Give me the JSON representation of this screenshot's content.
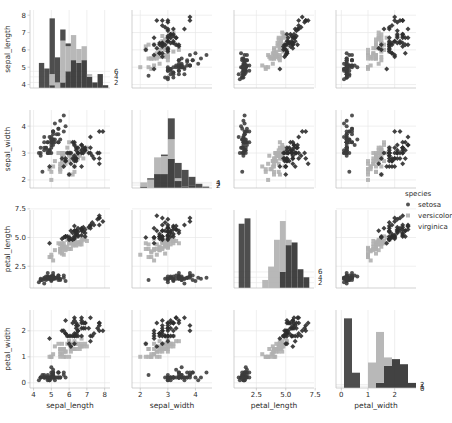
{
  "figure": {
    "kind": "pairplot",
    "background": "#ffffff",
    "grid_color": "#e8e8e8",
    "spine_color": "#bdbdbd"
  },
  "variables": [
    "sepal_length",
    "sepal_width",
    "petal_length",
    "petal_width"
  ],
  "axis_labels": {
    "sepal_length": "sepal_length",
    "sepal_width": "sepal_width",
    "petal_length": "petal_length",
    "petal_width": "petal_width"
  },
  "axes_config": {
    "sepal_length": {
      "min": 3.8,
      "max": 8.3,
      "ticks": [
        4,
        5,
        6,
        7,
        8
      ],
      "tick_labels": [
        "4",
        "5",
        "6",
        "7",
        "8"
      ]
    },
    "sepal_width": {
      "min": 1.7,
      "max": 4.6,
      "ticks": [
        2,
        3,
        4
      ],
      "tick_labels": [
        "2",
        "3",
        "4"
      ]
    },
    "petal_length": {
      "min": 0.6,
      "max": 7.4,
      "ticks": [
        2.5,
        5.0,
        7.5
      ],
      "tick_labels": [
        "2.5",
        "5.0",
        "7.5"
      ]
    },
    "petal_width": {
      "min": -0.2,
      "max": 2.8,
      "ticks": [
        0,
        1,
        2
      ],
      "tick_labels": [
        "0",
        "1",
        "2"
      ]
    }
  },
  "diagonal_axes_config": {
    "sepal_length": {
      "ticks": [
        2,
        4,
        6
      ],
      "tick_labels": [
        "2",
        "4",
        "6"
      ]
    },
    "sepal_width": {
      "ticks": [
        2,
        3,
        4
      ],
      "tick_labels": [
        "2",
        "3",
        "4"
      ]
    },
    "petal_length": {
      "ticks": [
        2,
        4,
        6
      ],
      "tick_labels": [
        "2",
        "4",
        "6"
      ]
    },
    "petal_width": {
      "ticks": [
        0,
        1,
        2
      ],
      "tick_labels": [
        "0",
        "1",
        "2"
      ]
    }
  },
  "legend": {
    "title": "species",
    "entries": [
      {
        "label": "setosa",
        "color": "#3b3b3b",
        "marker": "circle"
      },
      {
        "label": "versicolor",
        "color": "#b0b0b0",
        "marker": "square"
      },
      {
        "label": "virginica",
        "color": "#2e2e2e",
        "marker": "diamond"
      }
    ]
  },
  "chart_data": {
    "type": "scatter",
    "title": "",
    "xlabel": "",
    "ylabel": "",
    "pairplot": true,
    "diagonal": "histogram",
    "grid": true,
    "legend_position": "right",
    "variables": [
      "sepal_length",
      "sepal_width",
      "petal_length",
      "petal_width"
    ],
    "hue": "species",
    "series": [
      {
        "name": "setosa",
        "color": "#3b3b3b",
        "marker": "circle",
        "sepal_length": [
          5.1,
          4.9,
          4.7,
          4.6,
          5.0,
          5.4,
          4.6,
          5.0,
          4.4,
          4.9,
          5.4,
          4.8,
          4.8,
          4.3,
          5.8,
          5.7,
          5.4,
          5.1,
          5.7,
          5.1,
          5.4,
          5.1,
          4.6,
          5.1,
          4.8,
          5.0,
          5.0,
          5.2,
          5.2,
          4.7,
          4.8,
          5.4,
          5.2,
          5.5,
          4.9,
          5.0,
          5.5,
          4.9,
          4.4,
          5.1,
          5.0,
          4.5,
          4.4,
          5.0,
          5.1,
          4.8,
          5.1,
          4.6,
          5.3,
          5.0
        ],
        "sepal_width": [
          3.5,
          3.0,
          3.2,
          3.1,
          3.6,
          3.9,
          3.4,
          3.4,
          2.9,
          3.1,
          3.7,
          3.4,
          3.0,
          3.0,
          4.0,
          4.4,
          3.9,
          3.5,
          3.8,
          3.8,
          3.4,
          3.7,
          3.6,
          3.3,
          3.4,
          3.0,
          3.4,
          3.5,
          3.4,
          3.2,
          3.1,
          3.4,
          4.1,
          4.2,
          3.1,
          3.2,
          3.5,
          3.6,
          3.0,
          3.4,
          3.5,
          2.3,
          3.2,
          3.5,
          3.8,
          3.0,
          3.8,
          3.2,
          3.7,
          3.3
        ],
        "petal_length": [
          1.4,
          1.4,
          1.3,
          1.5,
          1.4,
          1.7,
          1.4,
          1.5,
          1.4,
          1.5,
          1.5,
          1.6,
          1.4,
          1.1,
          1.2,
          1.5,
          1.3,
          1.4,
          1.7,
          1.5,
          1.7,
          1.5,
          1.0,
          1.7,
          1.9,
          1.6,
          1.6,
          1.5,
          1.4,
          1.6,
          1.6,
          1.5,
          1.5,
          1.4,
          1.5,
          1.2,
          1.3,
          1.4,
          1.3,
          1.5,
          1.3,
          1.3,
          1.3,
          1.6,
          1.9,
          1.4,
          1.6,
          1.4,
          1.5,
          1.4
        ],
        "petal_width": [
          0.2,
          0.2,
          0.2,
          0.2,
          0.2,
          0.4,
          0.3,
          0.2,
          0.2,
          0.1,
          0.2,
          0.2,
          0.1,
          0.1,
          0.2,
          0.4,
          0.4,
          0.3,
          0.3,
          0.3,
          0.2,
          0.4,
          0.2,
          0.5,
          0.2,
          0.2,
          0.4,
          0.2,
          0.2,
          0.2,
          0.2,
          0.4,
          0.1,
          0.2,
          0.2,
          0.2,
          0.2,
          0.1,
          0.2,
          0.2,
          0.3,
          0.3,
          0.2,
          0.6,
          0.4,
          0.3,
          0.2,
          0.2,
          0.2,
          0.2
        ]
      },
      {
        "name": "versicolor",
        "color": "#b0b0b0",
        "marker": "square",
        "sepal_length": [
          7.0,
          6.4,
          6.9,
          5.5,
          6.5,
          5.7,
          6.3,
          4.9,
          6.6,
          5.2,
          5.0,
          5.9,
          6.0,
          6.1,
          5.6,
          6.7,
          5.6,
          5.8,
          6.2,
          5.6,
          5.9,
          6.1,
          6.3,
          6.1,
          6.4,
          6.6,
          6.8,
          6.7,
          6.0,
          5.7,
          5.5,
          5.5,
          5.8,
          6.0,
          5.4,
          6.0,
          6.7,
          6.3,
          5.6,
          5.5,
          5.5,
          6.1,
          5.8,
          5.0,
          5.6,
          5.7,
          5.7,
          6.2,
          5.1,
          5.7
        ],
        "sepal_width": [
          3.2,
          3.2,
          3.1,
          2.3,
          2.8,
          2.8,
          3.3,
          2.4,
          2.9,
          2.7,
          2.0,
          3.0,
          2.2,
          2.9,
          2.9,
          3.1,
          3.0,
          2.7,
          2.2,
          2.5,
          3.2,
          2.8,
          2.5,
          2.8,
          2.9,
          3.0,
          2.8,
          3.0,
          2.9,
          2.6,
          2.4,
          2.4,
          2.7,
          2.7,
          3.0,
          3.4,
          3.1,
          2.3,
          3.0,
          2.5,
          2.6,
          3.0,
          2.6,
          2.3,
          2.7,
          3.0,
          2.9,
          2.9,
          2.5,
          2.8
        ],
        "petal_length": [
          4.7,
          4.5,
          4.9,
          4.0,
          4.6,
          4.5,
          4.7,
          3.3,
          4.6,
          3.9,
          3.5,
          4.2,
          4.0,
          4.7,
          3.6,
          4.4,
          4.5,
          4.1,
          4.5,
          3.9,
          4.8,
          4.0,
          4.9,
          4.7,
          4.3,
          4.4,
          4.8,
          5.0,
          4.5,
          3.5,
          3.8,
          3.7,
          3.9,
          5.1,
          4.5,
          4.5,
          4.7,
          4.4,
          4.1,
          4.0,
          4.4,
          4.6,
          4.0,
          3.3,
          4.2,
          4.2,
          4.2,
          4.3,
          3.0,
          4.1
        ],
        "petal_width": [
          1.4,
          1.5,
          1.5,
          1.3,
          1.5,
          1.3,
          1.6,
          1.0,
          1.3,
          1.4,
          1.0,
          1.5,
          1.0,
          1.4,
          1.3,
          1.4,
          1.5,
          1.0,
          1.5,
          1.1,
          1.8,
          1.3,
          1.5,
          1.2,
          1.3,
          1.4,
          1.4,
          1.7,
          1.5,
          1.0,
          1.1,
          1.0,
          1.2,
          1.6,
          1.5,
          1.6,
          1.5,
          1.3,
          1.3,
          1.3,
          1.2,
          1.4,
          1.2,
          1.0,
          1.3,
          1.2,
          1.3,
          1.3,
          1.1,
          1.3
        ]
      },
      {
        "name": "virginica",
        "color": "#2e2e2e",
        "marker": "diamond",
        "sepal_length": [
          6.3,
          5.8,
          7.1,
          6.3,
          6.5,
          7.6,
          4.9,
          7.3,
          6.7,
          7.2,
          6.5,
          6.4,
          6.8,
          5.7,
          5.8,
          6.4,
          6.5,
          7.7,
          7.7,
          6.0,
          6.9,
          5.6,
          7.7,
          6.3,
          6.7,
          7.2,
          6.2,
          6.1,
          6.4,
          7.2,
          7.4,
          7.9,
          6.4,
          6.3,
          6.1,
          7.7,
          6.3,
          6.4,
          6.0,
          6.9,
          6.7,
          6.9,
          5.8,
          6.8,
          6.7,
          6.7,
          6.3,
          6.5,
          6.2,
          5.9
        ],
        "sepal_width": [
          3.3,
          2.7,
          3.0,
          2.9,
          3.0,
          3.0,
          2.5,
          2.9,
          2.5,
          3.6,
          3.2,
          2.7,
          3.0,
          2.5,
          2.8,
          3.2,
          3.0,
          3.8,
          2.6,
          2.2,
          3.2,
          2.8,
          2.8,
          2.7,
          3.3,
          3.2,
          2.8,
          3.0,
          2.8,
          3.0,
          2.8,
          3.8,
          2.8,
          2.8,
          2.6,
          3.0,
          3.4,
          3.1,
          3.0,
          3.1,
          3.1,
          3.1,
          2.7,
          3.2,
          3.3,
          3.0,
          2.5,
          3.0,
          3.4,
          3.0
        ],
        "petal_length": [
          6.0,
          5.1,
          5.9,
          5.6,
          5.8,
          6.6,
          4.5,
          6.3,
          5.8,
          6.1,
          5.1,
          5.3,
          5.5,
          5.0,
          5.1,
          5.3,
          5.5,
          6.7,
          6.9,
          5.0,
          5.7,
          4.9,
          6.7,
          4.9,
          5.7,
          6.0,
          4.8,
          4.9,
          5.6,
          5.8,
          6.1,
          6.4,
          5.6,
          5.1,
          5.6,
          6.1,
          5.6,
          5.5,
          4.8,
          5.4,
          5.6,
          5.1,
          5.1,
          5.9,
          5.7,
          5.2,
          5.0,
          5.2,
          5.4,
          5.1
        ],
        "petal_width": [
          2.5,
          1.9,
          2.1,
          1.8,
          2.2,
          2.1,
          1.7,
          1.8,
          1.8,
          2.5,
          2.0,
          1.9,
          2.1,
          2.0,
          2.4,
          2.3,
          1.8,
          2.2,
          2.3,
          1.5,
          2.3,
          2.0,
          2.0,
          1.8,
          2.1,
          1.8,
          1.8,
          1.8,
          2.1,
          1.6,
          1.9,
          2.0,
          2.2,
          1.5,
          1.4,
          2.3,
          2.4,
          1.8,
          1.8,
          2.1,
          2.4,
          2.3,
          1.9,
          2.3,
          2.5,
          2.3,
          1.9,
          2.0,
          2.3,
          1.8
        ]
      }
    ],
    "diagonal_histograms": {
      "sepal_length": {
        "bin_width": 0.3,
        "bin_start": 4.3,
        "stacked": true
      },
      "sepal_width": {
        "bin_width": 0.25,
        "bin_start": 2.0,
        "stacked": true
      },
      "petal_length": {
        "bin_width": 0.5,
        "bin_start": 1.0,
        "stacked": true
      },
      "petal_width": {
        "bin_width": 0.3,
        "bin_start": 0.1,
        "stacked": true
      }
    }
  }
}
